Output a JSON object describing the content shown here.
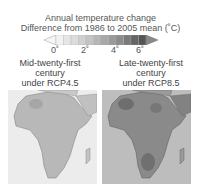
{
  "figure": {
    "title_line1": "Annual temperature change",
    "title_line2": "Difference from 1986 to 2005 mean (˚C)"
  },
  "colorbar": {
    "ticks": [
      "0˚",
      "2˚",
      "4˚",
      "6˚"
    ],
    "min": -1,
    "max": 7,
    "extend": "both",
    "colors": [
      "#f2f2f2",
      "#e6e6e6",
      "#dcdcdc",
      "#d0d0d0",
      "#c4c4c4",
      "#b6b6b6",
      "#a8a8a8",
      "#9a9a9a",
      "#8c8c8c",
      "#7a7a7a",
      "#666666",
      "#555555"
    ]
  },
  "panels": [
    {
      "label_line1": "Mid-twenty-first",
      "label_line2": "century",
      "label_line3": "under RCP4.5",
      "region": "Africa",
      "ocean_color": "#ececec",
      "land_color": "#b8b8b8",
      "hotspot_color": "#a6a6a6"
    },
    {
      "label_line1": "Late-twenty-first",
      "label_line2": "century",
      "label_line3": "under RCP8.5",
      "region": "Africa",
      "ocean_color": "#bdbdbd",
      "land_color": "#8a8a8a",
      "hotspot_color": "#6e6e6e"
    }
  ]
}
